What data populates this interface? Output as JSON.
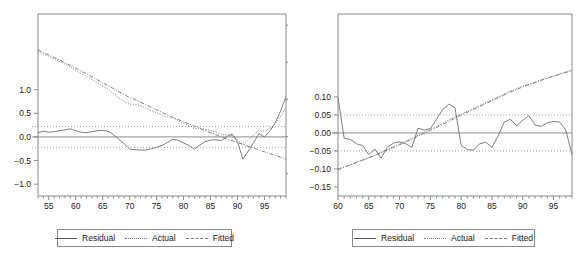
{
  "figure": {
    "background": "#ffffff",
    "line_color": "#6f6f6f",
    "axis_color": "#8a8a8a",
    "text_color": "#1a1a1a"
  },
  "legend": {
    "residual_label": "Residual",
    "actual_label": "Actual",
    "fitted_label": "Fitted"
  },
  "chart_data": [
    {
      "type": "line",
      "title": "",
      "xlabel": "",
      "ylabel": "",
      "panel": "left",
      "grid": false,
      "legend_position": "bottom",
      "xlim": [
        53,
        99
      ],
      "xticks": [
        55,
        60,
        65,
        70,
        75,
        80,
        85,
        90,
        95
      ],
      "xticklabels": [
        "55",
        "60",
        "65",
        "70",
        "75",
        "80",
        "85",
        "90",
        "95"
      ],
      "left_axis": {
        "name": "Residual",
        "ylim": [
          -1.25,
          2.6
        ],
        "yticks": [
          1.0,
          0.5,
          0.0,
          -0.5,
          -1.0
        ],
        "yticklabels": [
          "1.0",
          "0.5",
          "0.0",
          "-0.5",
          "-1.0"
        ],
        "bands": [
          0.22,
          -0.22
        ]
      },
      "right_axis": {
        "name": "Actual / Fitted",
        "ylim": [
          -3.6,
          1.3
        ],
        "yticks": [
          1,
          0,
          -1,
          -2,
          -3
        ],
        "yticklabels": [
          "1",
          "0",
          "-1",
          "-2",
          "-3"
        ]
      },
      "series": [
        {
          "name": "Residual",
          "axis": "left",
          "style": "solid",
          "x": [
            53,
            54,
            55,
            56,
            57,
            58,
            59,
            60,
            61,
            62,
            63,
            64,
            65,
            66,
            67,
            68,
            69,
            70,
            71,
            72,
            73,
            74,
            75,
            76,
            77,
            78,
            79,
            80,
            81,
            82,
            83,
            84,
            85,
            86,
            87,
            88,
            89,
            90,
            91,
            92,
            93,
            94,
            95,
            96,
            97,
            98,
            99
          ],
          "values": [
            0.09,
            0.12,
            0.1,
            0.11,
            0.13,
            0.15,
            0.17,
            0.13,
            0.1,
            0.09,
            0.11,
            0.13,
            0.14,
            0.12,
            0.05,
            -0.05,
            -0.15,
            -0.26,
            -0.27,
            -0.28,
            -0.28,
            -0.25,
            -0.22,
            -0.18,
            -0.12,
            -0.05,
            -0.07,
            -0.13,
            -0.18,
            -0.26,
            -0.17,
            -0.1,
            -0.07,
            -0.06,
            -0.08,
            0.01,
            0.06,
            -0.1,
            -0.47,
            -0.3,
            -0.12,
            0.07,
            0.0,
            0.12,
            0.3,
            0.55,
            0.85
          ]
        },
        {
          "name": "Actual",
          "axis": "right",
          "style": "dotted",
          "x": [
            53,
            54,
            55,
            56,
            57,
            58,
            59,
            60,
            61,
            62,
            63,
            64,
            65,
            66,
            67,
            68,
            69,
            70,
            71,
            72,
            73,
            74,
            75,
            76,
            77,
            78,
            79,
            80,
            81,
            82,
            83,
            84,
            85,
            86,
            87,
            88,
            89,
            90,
            91,
            92,
            93,
            94,
            95,
            96,
            97,
            98,
            99
          ],
          "values": [
            0.28,
            0.22,
            0.16,
            0.1,
            0.02,
            -0.05,
            -0.12,
            -0.22,
            -0.3,
            -0.38,
            -0.46,
            -0.55,
            -0.64,
            -0.72,
            -0.84,
            -0.96,
            -1.06,
            -1.13,
            -1.13,
            -1.17,
            -1.23,
            -1.3,
            -1.36,
            -1.42,
            -1.47,
            -1.5,
            -1.57,
            -1.65,
            -1.7,
            -1.78,
            -1.78,
            -1.8,
            -1.84,
            -1.88,
            -1.94,
            -1.95,
            -1.97,
            -2.08,
            -2.22,
            -2.1,
            -1.96,
            -1.82,
            -1.86,
            -1.78,
            -1.66,
            -1.46,
            -1.22
          ]
        },
        {
          "name": "Fitted",
          "axis": "right",
          "style": "dashdot",
          "x": [
            53,
            54,
            55,
            56,
            57,
            58,
            59,
            60,
            61,
            62,
            63,
            64,
            65,
            66,
            67,
            68,
            69,
            70,
            71,
            72,
            73,
            74,
            75,
            76,
            77,
            78,
            79,
            80,
            81,
            82,
            83,
            84,
            85,
            86,
            87,
            88,
            89,
            90,
            91,
            92,
            93,
            94,
            95,
            96,
            97,
            98,
            99
          ],
          "values": [
            0.33,
            0.26,
            0.2,
            0.13,
            0.06,
            -0.01,
            -0.08,
            -0.16,
            -0.24,
            -0.31,
            -0.39,
            -0.47,
            -0.55,
            -0.63,
            -0.71,
            -0.79,
            -0.87,
            -0.95,
            -1.0,
            -1.07,
            -1.14,
            -1.21,
            -1.28,
            -1.35,
            -1.42,
            -1.48,
            -1.54,
            -1.6,
            -1.66,
            -1.72,
            -1.78,
            -1.84,
            -1.9,
            -1.95,
            -2.01,
            -2.06,
            -2.11,
            -2.16,
            -2.21,
            -2.26,
            -2.31,
            -2.36,
            -2.41,
            -2.46,
            -2.51,
            -2.56,
            -2.61
          ]
        }
      ]
    },
    {
      "type": "line",
      "title": "",
      "xlabel": "",
      "ylabel": "",
      "panel": "right",
      "grid": false,
      "legend_position": "bottom",
      "xlim": [
        60,
        98
      ],
      "xticks": [
        60,
        65,
        70,
        75,
        80,
        85,
        90,
        95
      ],
      "xticklabels": [
        "60",
        "65",
        "70",
        "75",
        "80",
        "85",
        "90",
        "95"
      ],
      "left_axis": {
        "name": "Residual",
        "ylim": [
          -0.175,
          0.33
        ],
        "yticks": [
          0.1,
          0.05,
          0.0,
          -0.05,
          -0.1,
          -0.15
        ],
        "yticklabels": [
          "0.10",
          "0.05",
          "0.00",
          "-0.05",
          "-0.10",
          "-0.15"
        ],
        "bands": [
          0.05,
          -0.05
        ]
      },
      "right_axis": {
        "name": "Actual / Fitted",
        "ylim": [
          -2.55,
          1.25
        ],
        "yticks": [],
        "yticklabels": []
      },
      "series": [
        {
          "name": "Residual",
          "axis": "left",
          "style": "solid",
          "x": [
            60,
            61,
            62,
            63,
            64,
            65,
            66,
            67,
            68,
            69,
            70,
            71,
            72,
            73,
            74,
            75,
            76,
            77,
            78,
            79,
            80,
            81,
            82,
            83,
            84,
            85,
            86,
            87,
            88,
            89,
            90,
            91,
            92,
            93,
            94,
            95,
            96,
            97,
            98
          ],
          "values": [
            0.098,
            -0.015,
            -0.018,
            -0.03,
            -0.035,
            -0.06,
            -0.045,
            -0.07,
            -0.04,
            -0.028,
            -0.025,
            -0.03,
            -0.04,
            0.013,
            0.008,
            0.012,
            0.038,
            0.065,
            0.08,
            0.07,
            -0.035,
            -0.046,
            -0.048,
            -0.03,
            -0.026,
            -0.04,
            -0.008,
            0.03,
            0.038,
            0.02,
            0.035,
            0.048,
            0.022,
            0.018,
            0.028,
            0.032,
            0.03,
            0.008,
            -0.06
          ]
        },
        {
          "name": "Actual",
          "axis": "right",
          "style": "dotted",
          "x": [
            60,
            62,
            64,
            66,
            68,
            70,
            72,
            74,
            76,
            78,
            80,
            82,
            84,
            86,
            88,
            90,
            92,
            94,
            96,
            98
          ],
          "values": [
            -1.98,
            -1.9,
            -1.8,
            -1.7,
            -1.58,
            -1.46,
            -1.34,
            -1.22,
            -1.1,
            -0.96,
            -0.84,
            -0.72,
            -0.6,
            -0.48,
            -0.36,
            -0.26,
            -0.17,
            -0.08,
            0.0,
            0.08
          ]
        },
        {
          "name": "Fitted",
          "axis": "right",
          "style": "dashdot",
          "x": [
            60,
            62,
            64,
            66,
            68,
            70,
            72,
            74,
            76,
            78,
            80,
            82,
            84,
            86,
            88,
            90,
            92,
            94,
            96,
            98
          ],
          "values": [
            -2.0,
            -1.9,
            -1.8,
            -1.7,
            -1.59,
            -1.48,
            -1.36,
            -1.24,
            -1.12,
            -0.99,
            -0.86,
            -0.74,
            -0.62,
            -0.5,
            -0.38,
            -0.27,
            -0.18,
            -0.09,
            -0.01,
            0.07
          ]
        }
      ]
    }
  ]
}
